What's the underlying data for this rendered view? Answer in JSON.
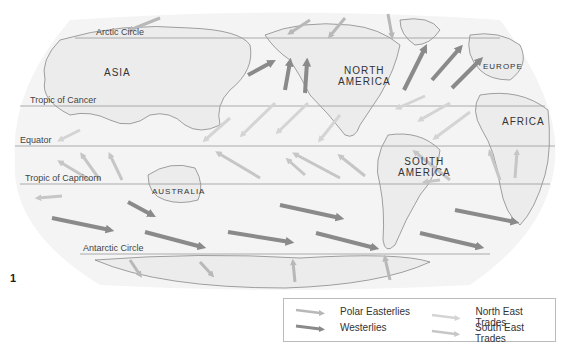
{
  "figure_number": "1",
  "latitude_lines": [
    {
      "label": "Arctic Circle",
      "y": 38
    },
    {
      "label": "Tropic of Cancer",
      "y": 106
    },
    {
      "label": "Equator",
      "y": 146
    },
    {
      "label": "Tropic of Capricorn",
      "y": 184
    },
    {
      "label": "Antarctic Circle",
      "y": 254
    }
  ],
  "continents": [
    {
      "label": "ASIA"
    },
    {
      "label": "NORTH AMERICA",
      "line1": "NORTH",
      "line2": "AMERICA"
    },
    {
      "label": "EUROPE"
    },
    {
      "label": "AFRICA"
    },
    {
      "label": "SOUTH AMERICA",
      "line1": "SOUTH",
      "line2": "AMERICA"
    },
    {
      "label": "AUSTRALIA"
    }
  ],
  "legend": {
    "items": [
      {
        "label": "Polar Easterlies",
        "color": "#b8b8b8"
      },
      {
        "label": "Westerlies",
        "color": "#8a8a8a"
      },
      {
        "label": "North East Trades",
        "color": "#d4d4d4"
      },
      {
        "label": "South East Trades",
        "color": "#c6c6c6"
      }
    ]
  },
  "colors": {
    "polar_easterlies": "#b8b8b8",
    "westerlies": "#8a8a8a",
    "ne_trades": "#d4d4d4",
    "se_trades": "#c6c6c6",
    "land": "#ececec",
    "ocean": "#f4f4f4"
  }
}
